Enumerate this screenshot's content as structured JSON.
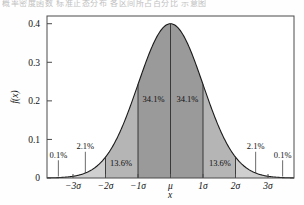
{
  "top_caption": "概率密度函数 标准正态分布 各区间所占百分比 示意图",
  "chart_data": {
    "type": "area",
    "title": "",
    "xlabel": "x",
    "ylabel": "f(x)",
    "xlim": [
      -3.8,
      3.8
    ],
    "ylim": [
      0,
      0.42
    ],
    "grid": false,
    "legend": null,
    "distribution": "standard normal",
    "peak_value": 0.4,
    "x_tick_values": [
      -3,
      -2,
      -1,
      0,
      1,
      2,
      3
    ],
    "x_tick_labels": [
      "−3σ",
      "−2σ",
      "−1σ",
      "μ",
      "1σ",
      "2σ",
      "3σ"
    ],
    "y_tick_values": [
      0,
      0.1,
      0.2,
      0.3,
      0.4
    ],
    "y_tick_labels": [
      "0",
      "0.1",
      "0.2",
      "0.3",
      "0.4"
    ],
    "bands": [
      {
        "name": "left-outer-tail",
        "from": -3.8,
        "to": -3,
        "percent": "0.1%",
        "value": 0.1,
        "shade": "#d9d9d9",
        "label_placement": "leader"
      },
      {
        "name": "left-2to3",
        "from": -3,
        "to": -2,
        "percent": "2.1%",
        "value": 2.1,
        "shade": "#cfcfcf",
        "label_placement": "leader"
      },
      {
        "name": "left-1to2",
        "from": -2,
        "to": -1,
        "percent": "13.6%",
        "value": 13.6,
        "shade": "#b5b5b5",
        "label_placement": "inside"
      },
      {
        "name": "left-0to1",
        "from": -1,
        "to": 0,
        "percent": "34.1%",
        "value": 34.1,
        "shade": "#9a9a9a",
        "label_placement": "inside"
      },
      {
        "name": "right-0to1",
        "from": 0,
        "to": 1,
        "percent": "34.1%",
        "value": 34.1,
        "shade": "#9a9a9a",
        "label_placement": "inside"
      },
      {
        "name": "right-1to2",
        "from": 1,
        "to": 2,
        "percent": "13.6%",
        "value": 13.6,
        "shade": "#b5b5b5",
        "label_placement": "inside"
      },
      {
        "name": "right-2to3",
        "from": 2,
        "to": 3,
        "percent": "2.1%",
        "value": 2.1,
        "shade": "#cfcfcf",
        "label_placement": "leader"
      },
      {
        "name": "right-outer-tail",
        "from": 3,
        "to": 3.8,
        "percent": "0.1%",
        "value": 0.1,
        "shade": "#d9d9d9",
        "label_placement": "leader"
      }
    ],
    "annotations": [
      {
        "text": "0.1%",
        "x": -3.45,
        "y": 0.052
      },
      {
        "text": "2.1%",
        "x": -2.62,
        "y": 0.074
      },
      {
        "text": "13.6%",
        "x": -1.52,
        "y": 0.03
      },
      {
        "text": "34.1%",
        "x": -0.52,
        "y": 0.197
      },
      {
        "text": "34.1%",
        "x": 0.52,
        "y": 0.197
      },
      {
        "text": "13.6%",
        "x": 1.52,
        "y": 0.03
      },
      {
        "text": "2.1%",
        "x": 2.62,
        "y": 0.074
      },
      {
        "text": "0.1%",
        "x": 3.45,
        "y": 0.052
      }
    ],
    "colors": {
      "band_center": "#9a9a9a",
      "band_mid": "#b5b5b5",
      "band_outer": "#cfcfcf",
      "band_tail": "#d9d9d9",
      "curve": "#1a1a1a",
      "frame": "#4a4a4a",
      "text": "#111111",
      "background": "#fefefe"
    }
  }
}
